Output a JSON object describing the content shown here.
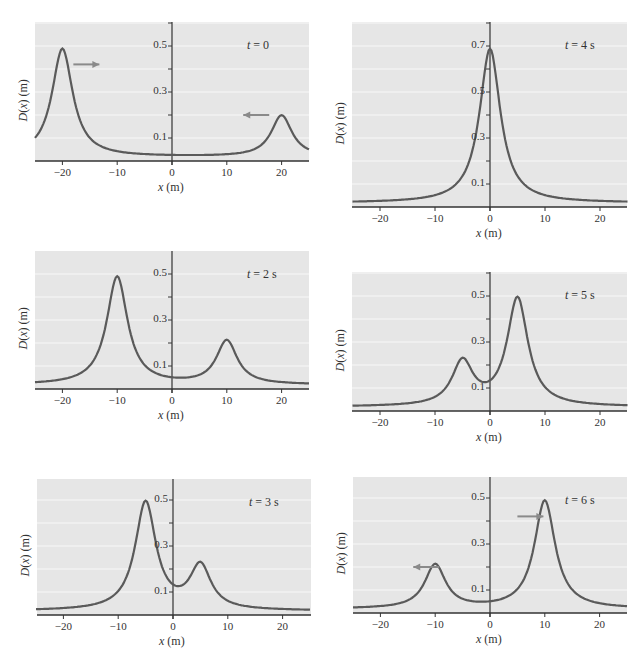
{
  "figure": {
    "ylabel": "D(x) (m)",
    "xlabel": "x (m)",
    "speed_label": "5 m/s"
  },
  "panels": [
    {
      "id": "t0",
      "time_label": "t = 0",
      "left": 35,
      "top": 22,
      "right": 309,
      "bottom": 161,
      "y_axis_x": 172,
      "ymax": 0.6,
      "arrows": [
        {
          "label": "5 m/s",
          "dir": "right",
          "x": -18,
          "y": 0.42
        },
        {
          "label": "5 m/s",
          "dir": "left",
          "x": 13,
          "y": 0.2
        }
      ]
    },
    {
      "id": "t4",
      "time_label": "t = 4 s",
      "left": 352,
      "top": 22,
      "right": 627,
      "bottom": 207,
      "y_axis_x": 490,
      "ymax": 0.8,
      "arrows": []
    },
    {
      "id": "t2",
      "time_label": "t = 2 s",
      "left": 35,
      "top": 251,
      "right": 309,
      "bottom": 389,
      "y_axis_x": 172,
      "ymax": 0.6,
      "arrows": []
    },
    {
      "id": "t5",
      "time_label": "t = 5 s",
      "left": 352,
      "top": 272,
      "right": 627,
      "bottom": 411,
      "y_axis_x": 490,
      "ymax": 0.6,
      "arrows": []
    },
    {
      "id": "t3",
      "time_label": "t = 3 s",
      "left": 37,
      "top": 479,
      "right": 311,
      "bottom": 615,
      "y_axis_x": 173,
      "ymax": 0.6,
      "arrows": []
    },
    {
      "id": "t6",
      "time_label": "t = 6 s",
      "left": 353,
      "top": 477,
      "right": 627,
      "bottom": 613,
      "y_axis_x": 490,
      "ymax": 0.6,
      "arrows": [
        {
          "label": "5 m/s",
          "dir": "left",
          "x": -14,
          "y": 0.2
        },
        {
          "label": "5 m/s",
          "dir": "right",
          "x": 5,
          "y": 0.42
        }
      ]
    }
  ],
  "colors": {
    "plot_bg": "#e6e6e6",
    "grid": "#f8f8f8",
    "curve": "#5a5a5a",
    "arrow": "#8a8a8a",
    "axis": "#333333"
  },
  "chart_data": [
    {
      "type": "line",
      "title": "t = 0",
      "xlabel": "x (m)",
      "ylabel": "D(x) (m)",
      "xlim": [
        -25,
        25
      ],
      "ylim": [
        0,
        0.6
      ],
      "x_ticks": [
        -20,
        -10,
        0,
        10,
        20
      ],
      "y_ticks": [
        0.1,
        0.3,
        0.5
      ],
      "grid": true,
      "pulses": [
        {
          "center": -20,
          "amplitude": 0.5,
          "velocity": 5
        },
        {
          "center": 20,
          "amplitude": 0.2,
          "velocity": -5
        }
      ],
      "series": [
        {
          "name": "D(x)",
          "x": [
            -25,
            -20,
            -15,
            -10,
            0,
            10,
            15,
            20,
            25
          ],
          "y": [
            0.08,
            0.5,
            0.08,
            0.04,
            0.03,
            0.03,
            0.04,
            0.2,
            0.05
          ]
        }
      ],
      "annotations": [
        "5 m/s (right arrow)",
        "5 m/s (left arrow)"
      ]
    },
    {
      "type": "line",
      "title": "t = 2 s",
      "xlabel": "x (m)",
      "ylabel": "D(x) (m)",
      "xlim": [
        -25,
        25
      ],
      "ylim": [
        0,
        0.6
      ],
      "x_ticks": [
        -20,
        -10,
        0,
        10,
        20
      ],
      "y_ticks": [
        0.1,
        0.3,
        0.5
      ],
      "grid": true,
      "series": [
        {
          "name": "D(x)",
          "x": [
            -25,
            -15,
            -10,
            -5,
            0,
            5,
            10,
            15,
            25
          ],
          "y": [
            0.03,
            0.06,
            0.5,
            0.08,
            0.04,
            0.06,
            0.22,
            0.05,
            0.03
          ]
        }
      ]
    },
    {
      "type": "line",
      "title": "t = 3 s",
      "xlabel": "x (m)",
      "ylabel": "D(x) (m)",
      "xlim": [
        -25,
        25
      ],
      "ylim": [
        0,
        0.6
      ],
      "x_ticks": [
        -20,
        -10,
        0,
        10,
        20
      ],
      "y_ticks": [
        0.1,
        0.3,
        0.5
      ],
      "grid": true,
      "series": [
        {
          "name": "D(x)",
          "x": [
            -25,
            -10,
            -5,
            0,
            5,
            10,
            25
          ],
          "y": [
            0.02,
            0.07,
            0.51,
            0.11,
            0.22,
            0.06,
            0.02
          ]
        }
      ]
    },
    {
      "type": "line",
      "title": "t = 4 s",
      "xlabel": "x (m)",
      "ylabel": "D(x) (m)",
      "xlim": [
        -25,
        25
      ],
      "ylim": [
        0,
        0.8
      ],
      "x_ticks": [
        -20,
        -10,
        0,
        10,
        20
      ],
      "y_ticks": [
        0.1,
        0.3,
        0.5,
        0.7
      ],
      "grid": true,
      "series": [
        {
          "name": "D(x)",
          "x": [
            -25,
            -10,
            -5,
            0,
            5,
            10,
            25
          ],
          "y": [
            0.02,
            0.05,
            0.12,
            0.7,
            0.12,
            0.05,
            0.02
          ]
        }
      ]
    },
    {
      "type": "line",
      "title": "t = 5 s",
      "xlabel": "x (m)",
      "ylabel": "D(x) (m)",
      "xlim": [
        -25,
        25
      ],
      "ylim": [
        0,
        0.6
      ],
      "x_ticks": [
        -20,
        -10,
        0,
        10,
        20
      ],
      "y_ticks": [
        0.1,
        0.3,
        0.5
      ],
      "grid": true,
      "series": [
        {
          "name": "D(x)",
          "x": [
            -25,
            -10,
            -5,
            0,
            5,
            10,
            25
          ],
          "y": [
            0.02,
            0.06,
            0.22,
            0.11,
            0.51,
            0.07,
            0.02
          ]
        }
      ]
    },
    {
      "type": "line",
      "title": "t = 6 s",
      "xlabel": "x (m)",
      "ylabel": "D(x) (m)",
      "xlim": [
        -25,
        25
      ],
      "ylim": [
        0,
        0.6
      ],
      "x_ticks": [
        -20,
        -10,
        0,
        10,
        20
      ],
      "y_ticks": [
        0.1,
        0.3,
        0.5
      ],
      "grid": true,
      "pulses": [
        {
          "center": -10,
          "amplitude": 0.2,
          "velocity": -5
        },
        {
          "center": 10,
          "amplitude": 0.5,
          "velocity": 5
        }
      ],
      "series": [
        {
          "name": "D(x)",
          "x": [
            -25,
            -15,
            -10,
            -5,
            0,
            5,
            10,
            15,
            25
          ],
          "y": [
            0.03,
            0.05,
            0.22,
            0.06,
            0.04,
            0.08,
            0.5,
            0.06,
            0.03
          ]
        }
      ],
      "annotations": [
        "5 m/s (left arrow)",
        "5 m/s (right arrow)"
      ]
    }
  ],
  "curves": {
    "t0": [
      [
        -20,
        0.47
      ],
      [
        20,
        0.18
      ]
    ],
    "t2": [
      [
        -10,
        0.47
      ],
      [
        10,
        0.19
      ]
    ],
    "t3": [
      [
        -5,
        0.47
      ],
      [
        5,
        0.19
      ]
    ],
    "t4": [
      [
        0,
        0.67
      ]
    ],
    "t5": [
      [
        -5,
        0.19
      ],
      [
        5,
        0.47
      ]
    ],
    "t6": [
      [
        -10,
        0.19
      ],
      [
        10,
        0.47
      ]
    ]
  }
}
